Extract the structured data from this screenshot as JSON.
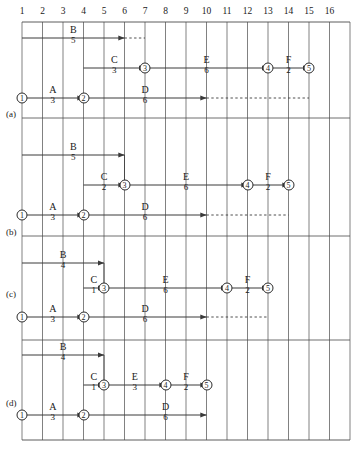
{
  "diagram": {
    "grid": {
      "columns": [
        "1",
        "2",
        "3",
        "4",
        "5",
        "6",
        "7",
        "8",
        "9",
        "10",
        "11",
        "12",
        "13",
        "14",
        "15",
        "16"
      ],
      "column_count": 16,
      "x_left": 22,
      "column_width": 20.5,
      "y_top": 22,
      "y_bottom": 440
    },
    "style": {
      "line_color": "#3a3a3a",
      "grid_color": "#4a4a4a",
      "background": "#ffffff"
    },
    "sections": [
      {
        "label": "(a)",
        "label_x": 6,
        "label_y": 110,
        "separator_y": 118,
        "lanes": {
          "top": 38,
          "middle": 68,
          "bottom": 98
        },
        "nodes": [
          {
            "id": "1",
            "glyph": "①",
            "col": 1,
            "lane": "bottom"
          },
          {
            "id": "2",
            "glyph": "②",
            "col": 4,
            "lane": "bottom"
          },
          {
            "id": "3",
            "glyph": "③",
            "col": 7,
            "lane": "middle"
          },
          {
            "id": "4",
            "glyph": "④",
            "col": 13,
            "lane": "middle"
          },
          {
            "id": "5",
            "glyph": "⑤",
            "col": 15,
            "lane": "middle"
          }
        ],
        "activities": [
          {
            "name": "A",
            "duration": "3",
            "lane": "bottom",
            "from_col": 1,
            "to_col": 4,
            "label_col": 2.5
          },
          {
            "name": "B",
            "duration": "5",
            "lane": "top",
            "from_col": 1,
            "to_col": 6,
            "label_col": 3.5,
            "dash_to_col": 7
          },
          {
            "name": "C",
            "duration": "3",
            "lane": "middle",
            "from_col": 4,
            "to_col": 7,
            "label_col": 5.5
          },
          {
            "name": "D",
            "duration": "6",
            "lane": "bottom",
            "from_col": 4,
            "to_col": 10,
            "label_col": 7.0,
            "dash_to_col": 15
          },
          {
            "name": "E",
            "duration": "6",
            "lane": "middle",
            "from_col": 7,
            "to_col": 13,
            "label_col": 10.0
          },
          {
            "name": "F",
            "duration": "2",
            "lane": "middle",
            "from_col": 13,
            "to_col": 15,
            "label_col": 14.0
          }
        ],
        "connectors": []
      },
      {
        "label": "(b)",
        "label_x": 6,
        "label_y": 228,
        "separator_y": 236,
        "lanes": {
          "top": 155,
          "middle": 185,
          "bottom": 215
        },
        "nodes": [
          {
            "id": "1",
            "glyph": "①",
            "col": 1,
            "lane": "bottom"
          },
          {
            "id": "2",
            "glyph": "②",
            "col": 4,
            "lane": "bottom"
          },
          {
            "id": "3",
            "glyph": "③",
            "col": 6,
            "lane": "middle"
          },
          {
            "id": "4",
            "glyph": "④",
            "col": 12,
            "lane": "middle"
          },
          {
            "id": "5",
            "glyph": "⑤",
            "col": 14,
            "lane": "middle"
          }
        ],
        "activities": [
          {
            "name": "A",
            "duration": "3",
            "lane": "bottom",
            "from_col": 1,
            "to_col": 4,
            "label_col": 2.5
          },
          {
            "name": "B",
            "duration": "5",
            "lane": "top",
            "from_col": 1,
            "to_col": 6,
            "label_col": 3.5
          },
          {
            "name": "C",
            "duration": "2",
            "lane": "middle",
            "from_col": 4,
            "to_col": 6,
            "label_col": 5.0
          },
          {
            "name": "D",
            "duration": "6",
            "lane": "bottom",
            "from_col": 4,
            "to_col": 10,
            "label_col": 7.0,
            "dash_to_col": 14
          },
          {
            "name": "E",
            "duration": "6",
            "lane": "middle",
            "from_col": 6,
            "to_col": 12,
            "label_col": 9.0
          },
          {
            "name": "F",
            "duration": "2",
            "lane": "middle",
            "from_col": 12,
            "to_col": 14,
            "label_col": 13.0
          }
        ],
        "connectors": [
          {
            "col": 6,
            "from_lane": "top",
            "to_lane": "middle"
          }
        ]
      },
      {
        "label": "(c)",
        "label_x": 6,
        "label_y": 290,
        "separator_y": 340,
        "lanes": {
          "top": 263,
          "middle": 288,
          "bottom": 317
        },
        "nodes": [
          {
            "id": "1",
            "glyph": "①",
            "col": 1,
            "lane": "bottom"
          },
          {
            "id": "2",
            "glyph": "②",
            "col": 4,
            "lane": "bottom"
          },
          {
            "id": "3",
            "glyph": "③",
            "col": 5,
            "lane": "middle"
          },
          {
            "id": "4",
            "glyph": "④",
            "col": 11,
            "lane": "middle"
          },
          {
            "id": "5",
            "glyph": "⑤",
            "col": 13,
            "lane": "middle"
          }
        ],
        "activities": [
          {
            "name": "A",
            "duration": "3",
            "lane": "bottom",
            "from_col": 1,
            "to_col": 4,
            "label_col": 2.5
          },
          {
            "name": "B",
            "duration": "4",
            "lane": "top",
            "from_col": 1,
            "to_col": 5,
            "label_col": 3.0
          },
          {
            "name": "C",
            "duration": "1",
            "lane": "middle",
            "from_col": 4,
            "to_col": 5,
            "label_col": 4.5
          },
          {
            "name": "D",
            "duration": "6",
            "lane": "bottom",
            "from_col": 4,
            "to_col": 10,
            "label_col": 7.0,
            "dash_to_col": 13
          },
          {
            "name": "E",
            "duration": "6",
            "lane": "middle",
            "from_col": 5,
            "to_col": 11,
            "label_col": 8.0
          },
          {
            "name": "F",
            "duration": "2",
            "lane": "middle",
            "from_col": 11,
            "to_col": 13,
            "label_col": 12.0
          }
        ],
        "connectors": [
          {
            "col": 5,
            "from_lane": "top",
            "to_lane": "middle"
          }
        ]
      },
      {
        "label": "(d)",
        "label_x": 6,
        "label_y": 399,
        "separator_y": 440,
        "lanes": {
          "top": 355,
          "middle": 385,
          "bottom": 415
        },
        "nodes": [
          {
            "id": "1",
            "glyph": "①",
            "col": 1,
            "lane": "bottom"
          },
          {
            "id": "2",
            "glyph": "②",
            "col": 4,
            "lane": "bottom"
          },
          {
            "id": "3",
            "glyph": "③",
            "col": 5,
            "lane": "middle"
          },
          {
            "id": "4",
            "glyph": "④",
            "col": 8,
            "lane": "middle"
          },
          {
            "id": "5",
            "glyph": "⑤",
            "col": 10,
            "lane": "middle"
          }
        ],
        "activities": [
          {
            "name": "A",
            "duration": "3",
            "lane": "bottom",
            "from_col": 1,
            "to_col": 4,
            "label_col": 2.5
          },
          {
            "name": "B",
            "duration": "4",
            "lane": "top",
            "from_col": 1,
            "to_col": 5,
            "label_col": 3.0
          },
          {
            "name": "C",
            "duration": "1",
            "lane": "middle",
            "from_col": 4,
            "to_col": 5,
            "label_col": 4.5
          },
          {
            "name": "D",
            "duration": "6",
            "lane": "bottom",
            "from_col": 4,
            "to_col": 10,
            "label_col": 8.0
          },
          {
            "name": "E",
            "duration": "3",
            "lane": "middle",
            "from_col": 5,
            "to_col": 8,
            "label_col": 6.5
          },
          {
            "name": "F",
            "duration": "2",
            "lane": "middle",
            "from_col": 8,
            "to_col": 10,
            "label_col": 9.0
          }
        ],
        "connectors": [
          {
            "col": 5,
            "from_lane": "top",
            "to_lane": "middle"
          }
        ]
      }
    ]
  }
}
